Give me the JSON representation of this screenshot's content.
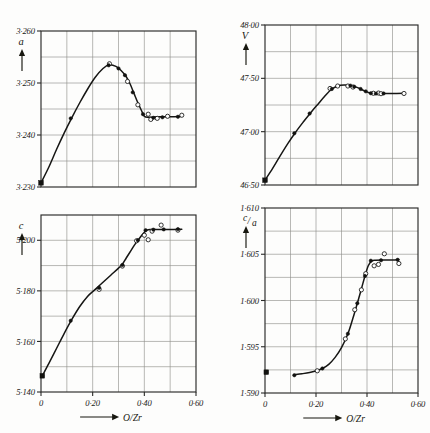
{
  "figure": {
    "name": "lattice-parameters-vs-oxygen-ratio",
    "background": "#fdfdfc",
    "ink": "#161614",
    "grid_color": "#8d8d88"
  },
  "xaxis_shared": {
    "label": "O/Zr",
    "ticks": [
      "0",
      "0·20",
      "0·40",
      "0·60"
    ],
    "tick_values": [
      0,
      0.2,
      0.4,
      0.6
    ],
    "min": 0,
    "max": 0.6,
    "minor_step": 0.1,
    "grid": true
  },
  "chart_data": [
    {
      "id": "panel-a",
      "type": "line",
      "title": "",
      "ylabel": "a",
      "xlabel": "O/Zr",
      "xlim": [
        0,
        0.6
      ],
      "ylim": [
        3.23,
        3.26
      ],
      "ytick_labels": [
        "3·260",
        "3·250",
        "3·240",
        "3·230"
      ],
      "ytick_values": [
        3.26,
        3.25,
        3.24,
        3.23
      ],
      "y_minor_step": 0.005,
      "grid": true,
      "legend": "",
      "curve": [
        [
          0.0,
          3.2308
        ],
        [
          0.03,
          3.2338
        ],
        [
          0.06,
          3.2372
        ],
        [
          0.09,
          3.2404
        ],
        [
          0.12,
          3.2434
        ],
        [
          0.15,
          3.2462
        ],
        [
          0.18,
          3.2488
        ],
        [
          0.21,
          3.2511
        ],
        [
          0.24,
          3.2528
        ],
        [
          0.265,
          3.2535
        ],
        [
          0.29,
          3.2532
        ],
        [
          0.31,
          3.2524
        ],
        [
          0.33,
          3.2512
        ],
        [
          0.345,
          3.2498
        ],
        [
          0.36,
          3.248
        ],
        [
          0.375,
          3.2462
        ],
        [
          0.39,
          3.2446
        ],
        [
          0.4,
          3.2436
        ],
        [
          0.415,
          3.2434
        ],
        [
          0.45,
          3.2435
        ],
        [
          0.5,
          3.2435
        ],
        [
          0.545,
          3.2436
        ]
      ],
      "points_filled": [
        [
          0.0,
          3.2308
        ],
        [
          0.115,
          3.2432
        ],
        [
          0.262,
          3.2534
        ],
        [
          0.3,
          3.2528
        ],
        [
          0.325,
          3.2515
        ],
        [
          0.355,
          3.2482
        ],
        [
          0.395,
          3.244
        ],
        [
          0.435,
          3.2433
        ],
        [
          0.47,
          3.2434
        ],
        [
          0.53,
          3.2435
        ]
      ],
      "points_open": [
        [
          0.265,
          3.2537
        ],
        [
          0.335,
          3.2503
        ],
        [
          0.375,
          3.2458
        ],
        [
          0.415,
          3.244
        ],
        [
          0.425,
          3.243
        ],
        [
          0.45,
          3.2432
        ],
        [
          0.49,
          3.2436
        ],
        [
          0.545,
          3.2438
        ]
      ],
      "points_square": [
        [
          0.0,
          3.2308
        ]
      ]
    },
    {
      "id": "panel-c",
      "type": "line",
      "title": "",
      "ylabel": "c",
      "xlabel": "O/Zr",
      "xlim": [
        0,
        0.6
      ],
      "ylim": [
        5.14,
        5.21
      ],
      "ytick_labels": [
        "5·200",
        "5·180",
        "5·160",
        "5·140"
      ],
      "ytick_values": [
        5.2,
        5.18,
        5.16,
        5.14
      ],
      "y_minor_step": 0.01,
      "grid": true,
      "legend": "",
      "curve": [
        [
          0.005,
          5.1464
        ],
        [
          0.03,
          5.1512
        ],
        [
          0.06,
          5.1572
        ],
        [
          0.09,
          5.1632
        ],
        [
          0.12,
          5.1688
        ],
        [
          0.15,
          5.1738
        ],
        [
          0.18,
          5.1778
        ],
        [
          0.21,
          5.1806
        ],
        [
          0.24,
          5.1834
        ],
        [
          0.27,
          5.1862
        ],
        [
          0.3,
          5.189
        ],
        [
          0.315,
          5.1905
        ],
        [
          0.33,
          5.193
        ],
        [
          0.35,
          5.1962
        ],
        [
          0.365,
          5.1986
        ],
        [
          0.38,
          5.2006
        ],
        [
          0.395,
          5.2026
        ],
        [
          0.41,
          5.204
        ],
        [
          0.425,
          5.2043
        ],
        [
          0.46,
          5.2043
        ],
        [
          0.5,
          5.2043
        ],
        [
          0.545,
          5.2044
        ]
      ],
      "points_filled": [
        [
          0.005,
          5.1464
        ],
        [
          0.115,
          5.1682
        ],
        [
          0.225,
          5.1812
        ],
        [
          0.315,
          5.1902
        ],
        [
          0.375,
          5.2
        ],
        [
          0.405,
          5.204
        ],
        [
          0.435,
          5.2042
        ],
        [
          0.475,
          5.2043
        ],
        [
          0.53,
          5.2044
        ]
      ],
      "points_open": [
        [
          0.225,
          5.1806
        ],
        [
          0.315,
          5.1898
        ],
        [
          0.37,
          5.1998
        ],
        [
          0.4,
          5.202
        ],
        [
          0.415,
          5.2002
        ],
        [
          0.43,
          5.2036
        ],
        [
          0.465,
          5.206
        ],
        [
          0.53,
          5.204
        ]
      ],
      "points_square": [
        [
          0.005,
          5.1464
        ]
      ]
    },
    {
      "id": "panel-v",
      "type": "line",
      "title": "",
      "ylabel": "V",
      "xlabel": "O/Zr",
      "xlim": [
        0,
        0.6
      ],
      "ylim": [
        46.5,
        48.0
      ],
      "ytick_labels": [
        "48·00",
        "47·50",
        "47·00",
        "46·50"
      ],
      "ytick_values": [
        48.0,
        47.5,
        47.0,
        46.5
      ],
      "y_minor_step": 0.25,
      "grid": true,
      "legend": "",
      "curve": [
        [
          0.0,
          46.545
        ],
        [
          0.03,
          46.655
        ],
        [
          0.06,
          46.775
        ],
        [
          0.09,
          46.89
        ],
        [
          0.12,
          46.995
        ],
        [
          0.15,
          47.09
        ],
        [
          0.18,
          47.18
        ],
        [
          0.21,
          47.265
        ],
        [
          0.235,
          47.335
        ],
        [
          0.26,
          47.395
        ],
        [
          0.285,
          47.428
        ],
        [
          0.31,
          47.437
        ],
        [
          0.335,
          47.433
        ],
        [
          0.355,
          47.42
        ],
        [
          0.375,
          47.4
        ],
        [
          0.39,
          47.382
        ],
        [
          0.405,
          47.368
        ],
        [
          0.425,
          47.36
        ],
        [
          0.455,
          47.358
        ],
        [
          0.5,
          47.358
        ],
        [
          0.545,
          47.36
        ]
      ],
      "points_filled": [
        [
          0.0,
          46.545
        ],
        [
          0.115,
          46.985
        ],
        [
          0.175,
          47.17
        ],
        [
          0.262,
          47.4
        ],
        [
          0.335,
          47.432
        ],
        [
          0.35,
          47.422
        ],
        [
          0.375,
          47.4
        ],
        [
          0.395,
          47.378
        ],
        [
          0.415,
          47.36
        ],
        [
          0.435,
          47.357
        ],
        [
          0.465,
          47.358
        ]
      ],
      "points_open": [
        [
          0.255,
          47.405
        ],
        [
          0.285,
          47.428
        ],
        [
          0.325,
          47.428
        ],
        [
          0.345,
          47.418
        ],
        [
          0.425,
          47.36
        ],
        [
          0.445,
          47.362
        ],
        [
          0.455,
          47.356
        ],
        [
          0.545,
          47.358
        ]
      ],
      "points_square": [
        [
          0.0,
          46.545
        ]
      ]
    },
    {
      "id": "panel-ca",
      "type": "line",
      "title": "",
      "ylabel": "c/a",
      "ylabel_num": "c",
      "ylabel_den": "a",
      "xlabel": "O/Zr",
      "xlim": [
        0,
        0.6
      ],
      "ylim": [
        1.59,
        1.61
      ],
      "ytick_labels": [
        "1·610",
        "1·605",
        "1·600",
        "1·595",
        "1·590"
      ],
      "ytick_values": [
        1.61,
        1.605,
        1.6,
        1.595,
        1.59
      ],
      "y_minor_step": 0.0025,
      "grid": true,
      "legend": "",
      "curve": [
        [
          0.115,
          1.59197
        ],
        [
          0.145,
          1.59208
        ],
        [
          0.175,
          1.59222
        ],
        [
          0.205,
          1.59243
        ],
        [
          0.225,
          1.59265
        ],
        [
          0.25,
          1.5931
        ],
        [
          0.275,
          1.59385
        ],
        [
          0.3,
          1.5949
        ],
        [
          0.325,
          1.5964
        ],
        [
          0.345,
          1.5981
        ],
        [
          0.362,
          1.5997
        ],
        [
          0.378,
          1.60125
        ],
        [
          0.392,
          1.60265
        ],
        [
          0.405,
          1.60375
        ],
        [
          0.418,
          1.60425
        ],
        [
          0.435,
          1.60435
        ],
        [
          0.47,
          1.60437
        ],
        [
          0.5,
          1.60437
        ],
        [
          0.525,
          1.60442
        ]
      ],
      "points_filled": [
        [
          0.005,
          1.59225
        ],
        [
          0.115,
          1.59192
        ],
        [
          0.225,
          1.59265
        ],
        [
          0.325,
          1.5964
        ],
        [
          0.362,
          1.5997
        ],
        [
          0.392,
          1.60265
        ],
        [
          0.415,
          1.6043
        ],
        [
          0.455,
          1.60435
        ],
        [
          0.52,
          1.6044
        ]
      ],
      "points_open": [
        [
          0.205,
          1.5924
        ],
        [
          0.315,
          1.59585
        ],
        [
          0.352,
          1.599
        ],
        [
          0.378,
          1.60115
        ],
        [
          0.395,
          1.6029
        ],
        [
          0.428,
          1.60375
        ],
        [
          0.445,
          1.6039
        ],
        [
          0.468,
          1.60505
        ],
        [
          0.525,
          1.604
        ]
      ],
      "points_square": [
        [
          0.005,
          1.59225
        ]
      ]
    }
  ]
}
